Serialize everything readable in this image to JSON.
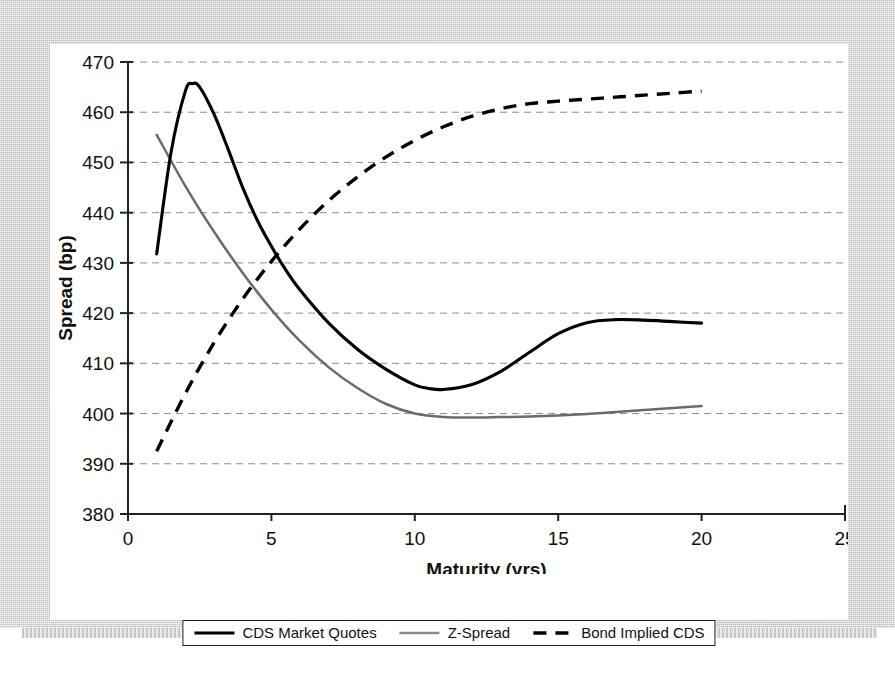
{
  "chart_data": {
    "type": "line",
    "title": "",
    "xlabel": "Maturity (yrs)",
    "ylabel": "Spread (bp)",
    "xlim": [
      0,
      25
    ],
    "ylim": [
      380,
      470
    ],
    "xticks": [
      "0",
      "5",
      "10",
      "15",
      "20",
      "25"
    ],
    "yticks": [
      "380",
      "390",
      "400",
      "410",
      "420",
      "430",
      "440",
      "450",
      "460",
      "470"
    ],
    "grid": "horizontal-dashed",
    "legend_position": "bottom-center",
    "series": [
      {
        "name": "CDS Market Quotes",
        "style": "solid",
        "color": "#000000",
        "x": [
          1,
          1.5,
          2,
          2.25,
          2.5,
          3,
          3.5,
          4,
          4.5,
          5,
          5.5,
          6,
          7,
          8,
          9,
          10,
          10.5,
          11,
          12,
          13,
          14,
          15,
          16,
          17,
          18,
          19,
          20
        ],
        "y": [
          431.8,
          452.0,
          464.2,
          465.7,
          465.0,
          459.6,
          452.5,
          445.0,
          438.6,
          433.3,
          428.6,
          424.6,
          418.0,
          412.8,
          408.8,
          405.7,
          405.0,
          404.8,
          405.8,
          408.4,
          412.2,
          415.9,
          418.1,
          418.7,
          418.6,
          418.3,
          418.0
        ]
      },
      {
        "name": "Z-Spread",
        "style": "solid",
        "color": "#6b6b6b",
        "x": [
          1,
          2,
          3,
          4,
          5,
          6,
          7,
          8,
          9,
          10,
          11,
          12,
          13,
          14,
          15,
          16,
          17,
          18,
          19,
          20
        ],
        "y": [
          455.5,
          445.3,
          436.2,
          428.0,
          420.7,
          414.4,
          409.2,
          405.1,
          401.9,
          400.0,
          399.3,
          399.2,
          399.3,
          399.4,
          399.6,
          399.9,
          400.3,
          400.7,
          401.1,
          401.5
        ]
      },
      {
        "name": "Bond Implied CDS",
        "style": "dashed",
        "color": "#000000",
        "x": [
          1,
          2,
          3,
          4,
          5,
          6,
          7,
          8,
          9,
          10,
          11,
          12,
          13,
          14,
          15,
          16,
          17,
          18,
          19,
          20
        ],
        "y": [
          392.5,
          404.0,
          414.1,
          422.8,
          430.3,
          436.8,
          442.4,
          447.1,
          451.1,
          454.4,
          457.1,
          459.2,
          460.7,
          461.7,
          462.2,
          462.6,
          463.0,
          463.4,
          463.8,
          464.2
        ]
      }
    ]
  },
  "legend": {
    "entries": [
      {
        "label": "CDS Market Quotes",
        "style": "solid",
        "color": "#000000"
      },
      {
        "label": "Z-Spread",
        "style": "solid",
        "color": "#6b6b6b"
      },
      {
        "label": "Bond Implied CDS",
        "style": "dashed",
        "color": "#000000"
      }
    ]
  }
}
